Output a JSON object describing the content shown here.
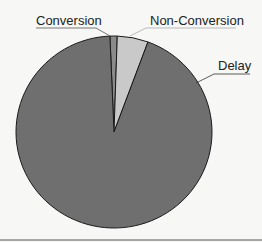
{
  "chart_data": {
    "type": "pie",
    "title": "",
    "categories": [
      "Conversion",
      "Non-Conversion",
      "Delay"
    ],
    "values": [
      1.2,
      5.1,
      93.7
    ],
    "units": "percent (estimated from slice angles)",
    "start_angle_deg_from_top": -2.4,
    "direction": "clockwise",
    "slices": [
      {
        "label": "Conversion",
        "value": 1.2,
        "color": "#8a8a8a"
      },
      {
        "label": "Non-Conversion",
        "value": 5.1,
        "color": "#c9c9c9"
      },
      {
        "label": "Delay",
        "value": 93.7,
        "color": "#6f6f6f"
      }
    ],
    "legend": "none (labels with leader lines)",
    "grid": false
  },
  "labels": {
    "conversion": "Conversion",
    "non_conversion": "Non-Conversion",
    "delay": "Delay"
  },
  "colors": {
    "background": "#f7f7f5",
    "outline": "#1a1a1a",
    "leader": "#333333",
    "rule": "#555555"
  }
}
